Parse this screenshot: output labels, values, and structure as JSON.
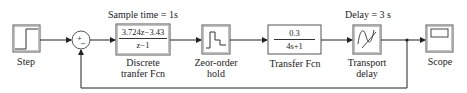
{
  "diagram": {
    "type": "simulink-block-diagram",
    "blocks": [
      {
        "id": "step",
        "label": "Step"
      },
      {
        "id": "sum",
        "signs": [
          "+",
          "-"
        ]
      },
      {
        "id": "discrete_tf",
        "label_line1": "Discrete",
        "label_line2": "tranfer Fcn",
        "numerator": "3.724z−3.43",
        "denominator": "z−1",
        "param": "Sample time  = 1s"
      },
      {
        "id": "zoh",
        "label_line1": "Zeor-order",
        "label_line2": "hold"
      },
      {
        "id": "transfer_fcn",
        "label": "Transfer Fcn",
        "numerator": "0.3",
        "denominator": "4s+1"
      },
      {
        "id": "transport_delay",
        "label_line1": "Transport",
        "label_line2": "delay",
        "param": "Delay = 3 s"
      },
      {
        "id": "scope",
        "label": "Scope"
      }
    ],
    "connections": [
      "step -> sum(+)",
      "sum -> discrete_tf",
      "discrete_tf -> zoh",
      "zoh -> transfer_fcn",
      "transfer_fcn -> transport_delay",
      "transport_delay -> scope",
      "transport_delay -> sum(-) feedback"
    ]
  }
}
